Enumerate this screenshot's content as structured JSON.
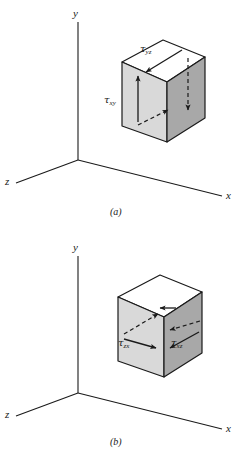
{
  "figure": {
    "background_color": "#ffffff",
    "line_color": "#1a1a1a"
  },
  "colors": {
    "top_face": "#ffffff",
    "front_face": "#d9d9d9",
    "right_face": "#a8a8a8",
    "outline": "#1a1a1a",
    "arrow": "#1a1a1a",
    "text": "#1a1a1a"
  },
  "panels": [
    {
      "id": "a",
      "caption": "(a)",
      "axes": {
        "y_label": "y",
        "x_label": "x",
        "z_label": "z"
      },
      "stress_labels": [
        {
          "id": "tau-yz",
          "tau": "τ",
          "subscript": "yz",
          "face": "top",
          "arrow": "solid",
          "direction": "down-left"
        },
        {
          "id": "tau-xy",
          "tau": "τ",
          "subscript": "xy",
          "face": "front",
          "arrow": "solid",
          "direction": "up"
        }
      ],
      "arrows": [
        {
          "id": "top-face-solid-arrow",
          "style": "solid",
          "face": "top",
          "direction": "down-left"
        },
        {
          "id": "right-face-dashed-arrow",
          "style": "dashed",
          "face": "right",
          "direction": "down"
        },
        {
          "id": "front-face-solid-arrow",
          "style": "solid",
          "face": "front",
          "direction": "up"
        },
        {
          "id": "bottom-dashed-arrow",
          "style": "dashed",
          "face": "front",
          "direction": "up-right"
        }
      ]
    },
    {
      "id": "b",
      "caption": "(b)",
      "axes": {
        "y_label": "y",
        "x_label": "x",
        "z_label": "z"
      },
      "stress_labels": [
        {
          "id": "tau-zx",
          "tau": "τ",
          "subscript": "zx",
          "face": "front",
          "arrow": "solid",
          "direction": "right"
        },
        {
          "id": "tau-xz",
          "tau": "τ",
          "subscript": "xz",
          "face": "right",
          "arrow": "solid",
          "direction": "left"
        }
      ],
      "arrows": [
        {
          "id": "front-face-solid-arrow",
          "style": "solid",
          "face": "front",
          "direction": "right"
        },
        {
          "id": "right-face-solid-arrow",
          "style": "solid",
          "face": "right",
          "direction": "left"
        },
        {
          "id": "top-face-dashed-arrow",
          "style": "dashed",
          "face": "top",
          "direction": "up-right"
        },
        {
          "id": "right-face-dashed-arrow",
          "style": "dashed",
          "face": "right",
          "direction": "left"
        }
      ]
    }
  ]
}
